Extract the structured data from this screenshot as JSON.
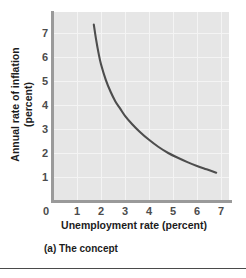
{
  "chart_data": {
    "type": "line",
    "title": "",
    "subtitle": "",
    "caption": "(a) The concept",
    "xlabel": "Unemployment rate (percent)",
    "ylabel": "Annual rate of inflation (percent)",
    "ylabel_lines": [
      "Annual rate of inflation",
      "(percent)"
    ],
    "xlim": [
      0,
      7.6
    ],
    "ylim": [
      0,
      7.7
    ],
    "xticks": [
      0,
      1,
      2,
      3,
      4,
      5,
      6,
      7
    ],
    "xticklabels": [
      "0",
      "1",
      "2",
      "3",
      "4",
      "5",
      "6",
      "7"
    ],
    "yticks": [
      1,
      2,
      3,
      4,
      5,
      6,
      7
    ],
    "yticklabels": [
      "1",
      "2",
      "3",
      "4",
      "5",
      "6",
      "7"
    ],
    "grid": true,
    "legend": "none",
    "series": [
      {
        "name": "Phillips curve",
        "x": [
          1.7,
          1.8,
          1.9,
          2.0,
          2.2,
          2.4,
          2.6,
          2.8,
          3.0,
          3.3,
          3.6,
          4.0,
          4.4,
          4.8,
          5.2,
          5.6,
          6.0,
          6.4,
          6.8
        ],
        "y": [
          7.35,
          6.7,
          6.15,
          5.7,
          5.05,
          4.55,
          4.15,
          3.85,
          3.55,
          3.2,
          2.9,
          2.55,
          2.25,
          2.0,
          1.8,
          1.62,
          1.46,
          1.32,
          1.18
        ]
      }
    ]
  },
  "axis": {
    "x_ticks": [
      {
        "label": "0",
        "value": 0
      },
      {
        "label": "1",
        "value": 1
      },
      {
        "label": "2",
        "value": 2
      },
      {
        "label": "3",
        "value": 3
      },
      {
        "label": "4",
        "value": 4
      },
      {
        "label": "5",
        "value": 5
      },
      {
        "label": "6",
        "value": 6
      },
      {
        "label": "7",
        "value": 7
      }
    ],
    "y_ticks": [
      {
        "label": "7",
        "value": 7
      },
      {
        "label": "6",
        "value": 6
      },
      {
        "label": "5",
        "value": 5
      },
      {
        "label": "4",
        "value": 4
      },
      {
        "label": "3",
        "value": 3
      },
      {
        "label": "2",
        "value": 2
      },
      {
        "label": "1",
        "value": 1
      }
    ]
  },
  "colors": {
    "plot_background": "#e6e6e6",
    "gridline": "#f4f4f4",
    "axis_line": "#9a9a9a",
    "curve": "#4d4d4d",
    "text": "#1c1c1c",
    "tick_text": "#4c4c4c",
    "page_background": "#ffffff",
    "rule": "#4a4a4a"
  }
}
